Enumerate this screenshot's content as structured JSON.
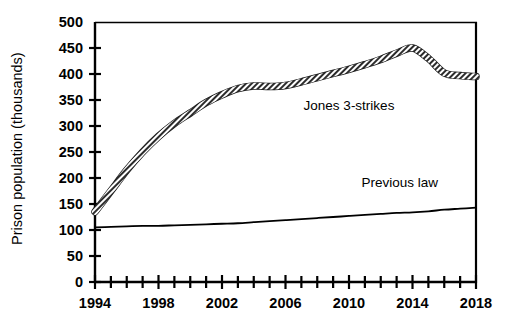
{
  "chart_data": {
    "type": "line",
    "title": "",
    "xlabel": "",
    "ylabel": "Prison population (thousands)",
    "xlim": [
      1994,
      2018
    ],
    "ylim": [
      0,
      500
    ],
    "y_ticks": [
      0,
      50,
      100,
      150,
      200,
      250,
      300,
      350,
      400,
      450,
      500
    ],
    "y_tick_labels": [
      "0",
      "50",
      "100",
      "150",
      "200",
      "250",
      "300",
      "350",
      "400",
      "450",
      "500"
    ],
    "x_ticks": [
      1994,
      1995,
      1996,
      1997,
      1998,
      1999,
      2000,
      2001,
      2002,
      2003,
      2004,
      2005,
      2006,
      2007,
      2008,
      2009,
      2010,
      2011,
      2012,
      2013,
      2014,
      2015,
      2016,
      2017,
      2018
    ],
    "x_tick_labels_shown": [
      "1994",
      "1998",
      "2002",
      "2006",
      "2010",
      "2014",
      "2018"
    ],
    "x_tick_labels_years": [
      1994,
      1998,
      2002,
      2006,
      2010,
      2014,
      2018
    ],
    "grid": false,
    "legend": "inline-annotations",
    "x": [
      1994,
      1995,
      1996,
      1997,
      1998,
      1999,
      2000,
      2001,
      2002,
      2003,
      2004,
      2005,
      2006,
      2007,
      2008,
      2009,
      2010,
      2011,
      2012,
      2013,
      2014,
      2015,
      2016,
      2017,
      2018
    ],
    "series": [
      {
        "name": "Jones 3-strikes",
        "style": "thick-hatched",
        "color": "#333333",
        "label_x": 2010.0,
        "label_y": 330,
        "values": [
          135,
          175,
          215,
          250,
          280,
          305,
          325,
          345,
          360,
          372,
          377,
          376,
          378,
          385,
          393,
          401,
          409,
          418,
          428,
          440,
          450,
          430,
          402,
          397,
          395
        ]
      },
      {
        "name": "Previous law",
        "style": "thin",
        "color": "#000000",
        "label_x": 2013.2,
        "label_y": 182,
        "values": [
          105,
          106,
          107,
          108,
          108,
          109,
          110,
          111,
          112,
          113,
          115,
          117,
          119,
          121,
          123,
          125,
          127,
          129,
          131,
          133,
          134,
          136,
          139,
          141,
          143
        ]
      }
    ]
  },
  "axes": {
    "y_axis_title": "Prison population (thousands)",
    "x_axis_title": ""
  }
}
